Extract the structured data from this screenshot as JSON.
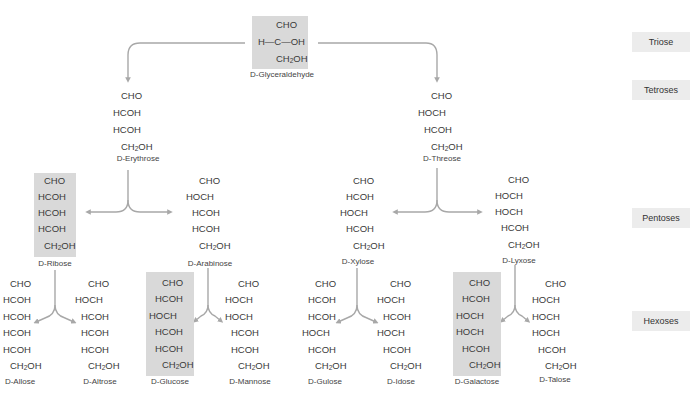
{
  "levels": [
    {
      "label": "Triose",
      "y": 32
    },
    {
      "label": "Tetroses",
      "y": 80
    },
    {
      "label": "Pentoses",
      "y": 208
    },
    {
      "label": "Hexoses",
      "y": 311
    }
  ],
  "colors": {
    "highlight": "#d9d9d9",
    "arrow": "#a8a8a8",
    "text": "#3a3a3a",
    "level_badge": "#ececec"
  },
  "molecules": {
    "glyceraldehyde": {
      "name": "D-Glyceraldehyde",
      "prefix": "D-",
      "base": "Glyceraldehyde",
      "highlighted": true,
      "rows": [
        "CHO",
        "H—C—OH",
        "CH2OH"
      ]
    },
    "erythrose": {
      "name": "D-Erythrose",
      "prefix": "D-",
      "base": "Erythrose",
      "highlighted": false,
      "rows": [
        "CHO",
        "HCOH",
        "HCOH",
        "CH2OH"
      ]
    },
    "threose": {
      "name": "D-Threose",
      "prefix": "D-",
      "base": "Threose",
      "highlighted": false,
      "rows": [
        "CHO",
        "HOCH",
        "HCOH",
        "CH2OH"
      ]
    },
    "ribose": {
      "name": "D-Ribose",
      "prefix": "D-",
      "base": "Ribose",
      "highlighted": true,
      "rows": [
        "CHO",
        "HCOH",
        "HCOH",
        "HCOH",
        "CH2OH"
      ]
    },
    "arabinose": {
      "name": "D-Arabinose",
      "prefix": "D-",
      "base": "Arabinose",
      "highlighted": false,
      "rows": [
        "CHO",
        "HOCH",
        "HCOH",
        "HCOH",
        "CH2OH"
      ]
    },
    "xylose": {
      "name": "D-Xylose",
      "prefix": "D-",
      "base": "Xylose",
      "highlighted": false,
      "rows": [
        "CHO",
        "HCOH",
        "HOCH",
        "HCOH",
        "CH2OH"
      ]
    },
    "lyxose": {
      "name": "D-Lyxose",
      "prefix": "D-",
      "base": "Lyxose",
      "highlighted": false,
      "rows": [
        "CHO",
        "HOCH",
        "HOCH",
        "HCOH",
        "CH2OH"
      ]
    },
    "allose": {
      "name": "D-Allose",
      "prefix": "D-",
      "base": "Allose",
      "highlighted": false,
      "rows": [
        "CHO",
        "HCOH",
        "HCOH",
        "HCOH",
        "HCOH",
        "CH2OH"
      ]
    },
    "altrose": {
      "name": "D-Altrose",
      "prefix": "D-",
      "base": "Altrose",
      "highlighted": false,
      "rows": [
        "CHO",
        "HOCH",
        "HCOH",
        "HCOH",
        "HCOH",
        "CH2OH"
      ]
    },
    "glucose": {
      "name": "D-Glucose",
      "prefix": "D-",
      "base": "Glucose",
      "highlighted": true,
      "rows": [
        "CHO",
        "HCOH",
        "HOCH",
        "HCOH",
        "HCOH",
        "CH2OH"
      ]
    },
    "mannose": {
      "name": "D-Mannose",
      "prefix": "D-",
      "base": "Mannose",
      "highlighted": false,
      "rows": [
        "CHO",
        "HOCH",
        "HOCH",
        "HCOH",
        "HCOH",
        "CH2OH"
      ]
    },
    "gulose": {
      "name": "D-Gulose",
      "prefix": "D-",
      "base": "Gulose",
      "highlighted": false,
      "rows": [
        "CHO",
        "HCOH",
        "HCOH",
        "HOCH",
        "HCOH",
        "CH2OH"
      ]
    },
    "idose": {
      "name": "D-Idose",
      "prefix": "D-",
      "base": "Idose",
      "highlighted": false,
      "rows": [
        "CHO",
        "HOCH",
        "HCOH",
        "HOCH",
        "HCOH",
        "CH2OH"
      ]
    },
    "galactose": {
      "name": "D-Galactose",
      "prefix": "D-",
      "base": "Galactose",
      "highlighted": true,
      "rows": [
        "CHO",
        "HCOH",
        "HOCH",
        "HOCH",
        "HCOH",
        "CH2OH"
      ]
    },
    "talose": {
      "name": "D-Talose",
      "prefix": "D-",
      "base": "Talose",
      "highlighted": false,
      "rows": [
        "CHO",
        "HOCH",
        "HOCH",
        "HOCH",
        "HCOH",
        "CH2OH"
      ]
    }
  },
  "edges": [
    [
      "glyceraldehyde",
      "erythrose"
    ],
    [
      "glyceraldehyde",
      "threose"
    ],
    [
      "erythrose",
      "ribose"
    ],
    [
      "erythrose",
      "arabinose"
    ],
    [
      "threose",
      "xylose"
    ],
    [
      "threose",
      "lyxose"
    ],
    [
      "ribose",
      "allose"
    ],
    [
      "ribose",
      "altrose"
    ],
    [
      "arabinose",
      "glucose"
    ],
    [
      "arabinose",
      "mannose"
    ],
    [
      "xylose",
      "gulose"
    ],
    [
      "xylose",
      "idose"
    ],
    [
      "lyxose",
      "galactose"
    ],
    [
      "lyxose",
      "talose"
    ]
  ]
}
